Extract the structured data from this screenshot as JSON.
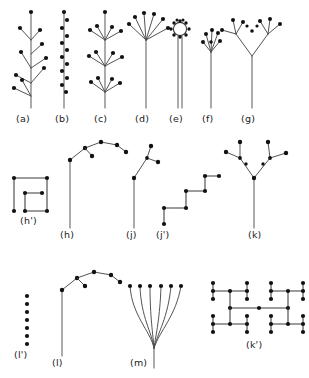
{
  "figure": {
    "background_color": "#ffffff",
    "stem_color": "#6e6e6e",
    "branch_color": "#4a4a4a",
    "node_color": "#111111",
    "schematic_color": "#3a3a3a",
    "width": 309,
    "height": 378,
    "row_count": 3
  },
  "labels": {
    "a": "(a)",
    "b": "(b)",
    "c": "(c)",
    "d": "(d)",
    "e": "(e)",
    "f": "(f)",
    "g": "(g)",
    "h_prime": "(h')",
    "h": "(h)",
    "j": "(j)",
    "j_prime": "(j')",
    "k": "(k)",
    "l_prime": "(l')",
    "l": "(l)",
    "m": "(m)",
    "k_prime": "(k')"
  },
  "panels": [
    {
      "id": "a",
      "label": "(a)",
      "row": 1,
      "type": "raceme-branched",
      "node_count": 11,
      "label_x": 16,
      "label_y": 121
    },
    {
      "id": "b",
      "label": "(b)",
      "row": 1,
      "type": "spike-sessile",
      "node_count": 14,
      "label_x": 55,
      "label_y": 121
    },
    {
      "id": "c",
      "label": "(c)",
      "row": 1,
      "type": "verticillate-whorls",
      "node_count": 16,
      "label_x": 95,
      "label_y": 121
    },
    {
      "id": "d",
      "label": "(d)",
      "row": 1,
      "type": "simple-umbel",
      "node_count": 7,
      "label_x": 136,
      "label_y": 121
    },
    {
      "id": "e",
      "label": "(e)",
      "row": 1,
      "type": "capitulum-head",
      "node_count": 12,
      "label_x": 172,
      "label_y": 121
    },
    {
      "id": "f",
      "label": "(f)",
      "row": 1,
      "type": "compact-corymb",
      "node_count": 7,
      "label_x": 204,
      "label_y": 121
    },
    {
      "id": "g",
      "label": "(g)",
      "row": 1,
      "type": "compound-dichasium",
      "node_count": 11,
      "label_x": 242,
      "label_y": 121
    },
    {
      "id": "h_prime",
      "label": "(h')",
      "row": 2,
      "type": "schematic-nested-rectangles",
      "node_count": 6,
      "label_x": 26,
      "label_y": 225
    },
    {
      "id": "h",
      "label": "(h)",
      "row": 2,
      "type": "scorpioid-cyme",
      "node_count": 6,
      "label_x": 63,
      "label_y": 237
    },
    {
      "id": "j",
      "label": "(j)",
      "row": 2,
      "type": "zigzag-cyme",
      "node_count": 3,
      "label_x": 129,
      "label_y": 237
    },
    {
      "id": "j_prime",
      "label": "(j')",
      "row": 2,
      "type": "schematic-staircase",
      "node_count": 6,
      "label_x": 159,
      "label_y": 237
    },
    {
      "id": "k",
      "label": "(k)",
      "row": 2,
      "type": "dichasial-cyme",
      "node_count": 9,
      "label_x": 250,
      "label_y": 237
    },
    {
      "id": "l_prime",
      "label": "(l')",
      "row": 3,
      "type": "schematic-dot-column",
      "node_count": 7,
      "label_x": 16,
      "label_y": 355
    },
    {
      "id": "l",
      "label": "(l)",
      "row": 3,
      "type": "helicoid-cyme",
      "node_count": 6,
      "label_x": 56,
      "label_y": 362
    },
    {
      "id": "m",
      "label": "(m)",
      "row": 3,
      "type": "flabellate-fan",
      "node_count": 6,
      "label_x": 137,
      "label_y": 362
    },
    {
      "id": "k_prime",
      "label": "(k')",
      "row": 3,
      "type": "schematic-lattice",
      "node_count": 25,
      "label_x": 248,
      "label_y": 345
    }
  ]
}
